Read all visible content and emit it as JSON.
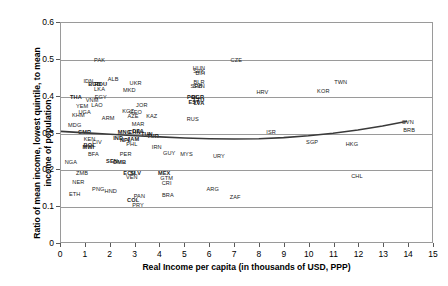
{
  "chart_data": {
    "type": "scatter",
    "title": "",
    "xlabel": "Real Income per capita (in thousands of USD, PPP)",
    "ylabel": "Ratio of mean income, lowest quintile, to mean income of population",
    "xlim": [
      0,
      15
    ],
    "ylim": [
      0,
      0.6
    ],
    "xticks": [
      "0",
      "1",
      "2",
      "3",
      "4",
      "5",
      "6",
      "7",
      "8",
      "9",
      "10",
      "11",
      "12",
      "13",
      "14",
      "15"
    ],
    "yticks": [
      "0",
      "0.1",
      "0.2",
      "0.3",
      "0.4",
      "0.5",
      "0.6"
    ],
    "grid": "horizontal",
    "legend": "none",
    "point_label_type": "iso3-country-code",
    "points": [
      {
        "label": "PAK",
        "x": 1.55,
        "y": 0.5
      },
      {
        "label": "CZE",
        "x": 7.05,
        "y": 0.5
      },
      {
        "label": "HUN",
        "x": 5.55,
        "y": 0.478
      },
      {
        "label": "SVK",
        "x": 5.55,
        "y": 0.47
      },
      {
        "label": "BIH",
        "x": 5.6,
        "y": 0.463
      },
      {
        "label": "IDN",
        "x": 1.1,
        "y": 0.443
      },
      {
        "label": "ALB",
        "x": 2.1,
        "y": 0.447
      },
      {
        "label": "BGD",
        "x": 1.35,
        "y": 0.435
      },
      {
        "label": "UKR",
        "x": 3.0,
        "y": 0.437
      },
      {
        "label": "ROU",
        "x": 1.6,
        "y": 0.435
      },
      {
        "label": "BLR",
        "x": 5.55,
        "y": 0.44
      },
      {
        "label": "SVN",
        "x": 5.55,
        "y": 0.43
      },
      {
        "label": "SRB",
        "x": 5.45,
        "y": 0.428
      },
      {
        "label": "LKA",
        "x": 1.55,
        "y": 0.422
      },
      {
        "label": "MKD",
        "x": 2.75,
        "y": 0.417
      },
      {
        "label": "HRV",
        "x": 8.1,
        "y": 0.412
      },
      {
        "label": "TWN",
        "x": 11.25,
        "y": 0.44
      },
      {
        "label": "THA",
        "x": 0.6,
        "y": 0.4
      },
      {
        "label": "EGY",
        "x": 1.6,
        "y": 0.4
      },
      {
        "label": "POL",
        "x": 5.3,
        "y": 0.4
      },
      {
        "label": "BGR",
        "x": 5.5,
        "y": 0.398
      },
      {
        "label": "VNM",
        "x": 1.25,
        "y": 0.39
      },
      {
        "label": "LTU",
        "x": 5.55,
        "y": 0.392
      },
      {
        "label": "EST",
        "x": 5.35,
        "y": 0.385
      },
      {
        "label": "LVA",
        "x": 5.55,
        "y": 0.383
      },
      {
        "label": "YEM",
        "x": 0.85,
        "y": 0.375
      },
      {
        "label": "LAO",
        "x": 1.45,
        "y": 0.378
      },
      {
        "label": "JOR",
        "x": 3.25,
        "y": 0.378
      },
      {
        "label": "KOR",
        "x": 10.55,
        "y": 0.415
      },
      {
        "label": "UGA",
        "x": 0.95,
        "y": 0.358
      },
      {
        "label": "KGZ",
        "x": 2.7,
        "y": 0.36
      },
      {
        "label": "GEO",
        "x": 3.0,
        "y": 0.358
      },
      {
        "label": "KHM",
        "x": 0.7,
        "y": 0.35
      },
      {
        "label": "AZE",
        "x": 2.9,
        "y": 0.348
      },
      {
        "label": "KAZ",
        "x": 3.65,
        "y": 0.348
      },
      {
        "label": "ARM",
        "x": 1.9,
        "y": 0.343
      },
      {
        "label": "RUS",
        "x": 5.3,
        "y": 0.34
      },
      {
        "label": "MDG",
        "x": 0.55,
        "y": 0.322
      },
      {
        "label": "MAR",
        "x": 3.1,
        "y": 0.325
      },
      {
        "label": "SVN2",
        "x": 13.95,
        "y": 0.33
      },
      {
        "label": "CMR",
        "x": 0.95,
        "y": 0.305
      },
      {
        "label": "CHN",
        "x": 2.95,
        "y": 0.305
      },
      {
        "label": "DZA",
        "x": 3.1,
        "y": 0.307
      },
      {
        "label": "MNG",
        "x": 2.55,
        "y": 0.303
      },
      {
        "label": "TUN",
        "x": 3.45,
        "y": 0.3
      },
      {
        "label": "ISR",
        "x": 8.45,
        "y": 0.305
      },
      {
        "label": "BRB",
        "x": 14.0,
        "y": 0.31
      },
      {
        "label": "KEN",
        "x": 1.15,
        "y": 0.285
      },
      {
        "label": "CIV",
        "x": 1.45,
        "y": 0.278
      },
      {
        "label": "TUR",
        "x": 3.7,
        "y": 0.293
      },
      {
        "label": "IND",
        "x": 2.3,
        "y": 0.288
      },
      {
        "label": "NPL",
        "x": 2.6,
        "y": 0.283
      },
      {
        "label": "JAM",
        "x": 2.9,
        "y": 0.285
      },
      {
        "label": "PHL",
        "x": 2.85,
        "y": 0.272
      },
      {
        "label": "BOL",
        "x": 1.15,
        "y": 0.268
      },
      {
        "label": "MWI",
        "x": 1.1,
        "y": 0.262
      },
      {
        "label": "IRN",
        "x": 3.85,
        "y": 0.262
      },
      {
        "label": "SGP",
        "x": 10.1,
        "y": 0.278
      },
      {
        "label": "HKG",
        "x": 11.7,
        "y": 0.272
      },
      {
        "label": "BFA",
        "x": 1.3,
        "y": 0.243
      },
      {
        "label": "PER",
        "x": 2.6,
        "y": 0.245
      },
      {
        "label": "GUY",
        "x": 4.35,
        "y": 0.248
      },
      {
        "label": "MYS",
        "x": 5.05,
        "y": 0.243
      },
      {
        "label": "URY",
        "x": 6.35,
        "y": 0.24
      },
      {
        "label": "NGA",
        "x": 0.4,
        "y": 0.223
      },
      {
        "label": "SEN",
        "x": 2.05,
        "y": 0.225
      },
      {
        "label": "GMB",
        "x": 2.35,
        "y": 0.222
      },
      {
        "label": "ZMB",
        "x": 0.85,
        "y": 0.192
      },
      {
        "label": "ECU",
        "x": 2.75,
        "y": 0.193
      },
      {
        "label": "SLV",
        "x": 3.0,
        "y": 0.193
      },
      {
        "label": "MEX",
        "x": 4.15,
        "y": 0.193
      },
      {
        "label": "CHL",
        "x": 11.9,
        "y": 0.185
      },
      {
        "label": "VEN",
        "x": 2.85,
        "y": 0.183
      },
      {
        "label": "GTM",
        "x": 4.25,
        "y": 0.18
      },
      {
        "label": "NER",
        "x": 0.7,
        "y": 0.168
      },
      {
        "label": "CRI",
        "x": 4.25,
        "y": 0.165
      },
      {
        "label": "PNG",
        "x": 1.5,
        "y": 0.148
      },
      {
        "label": "HND",
        "x": 2.0,
        "y": 0.143
      },
      {
        "label": "ARG",
        "x": 6.1,
        "y": 0.15
      },
      {
        "label": "ETH",
        "x": 0.55,
        "y": 0.135
      },
      {
        "label": "PAN",
        "x": 3.15,
        "y": 0.13
      },
      {
        "label": "BRA",
        "x": 4.3,
        "y": 0.132
      },
      {
        "label": "ZAF",
        "x": 7.0,
        "y": 0.128
      },
      {
        "label": "COL",
        "x": 2.9,
        "y": 0.12
      },
      {
        "label": "PRY",
        "x": 3.1,
        "y": 0.105
      }
    ],
    "trend_line": {
      "present": true,
      "style": "solid",
      "color": "#3a3a3a",
      "points": [
        {
          "x": 0.0,
          "y": 0.303
        },
        {
          "x": 1.0,
          "y": 0.299
        },
        {
          "x": 2.0,
          "y": 0.295
        },
        {
          "x": 3.0,
          "y": 0.291
        },
        {
          "x": 4.0,
          "y": 0.288
        },
        {
          "x": 5.0,
          "y": 0.285
        },
        {
          "x": 6.0,
          "y": 0.283
        },
        {
          "x": 7.0,
          "y": 0.282
        },
        {
          "x": 8.0,
          "y": 0.283
        },
        {
          "x": 9.0,
          "y": 0.286
        },
        {
          "x": 10.0,
          "y": 0.291
        },
        {
          "x": 11.0,
          "y": 0.298
        },
        {
          "x": 12.0,
          "y": 0.307
        },
        {
          "x": 13.0,
          "y": 0.318
        },
        {
          "x": 14.0,
          "y": 0.331
        }
      ]
    }
  }
}
